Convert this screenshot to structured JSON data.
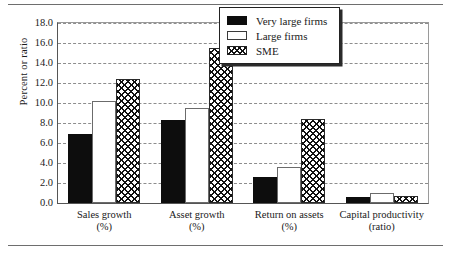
{
  "chart_data": {
    "type": "bar",
    "title": "",
    "xlabel": "",
    "ylabel": "Percent or ratio",
    "ylim": [
      0.0,
      18.0
    ],
    "ytick_step": 2.0,
    "ytick_labels": [
      "0.0",
      "2.0",
      "4.0",
      "6.0",
      "8.0",
      "10.0",
      "12.0",
      "14.0",
      "16.0",
      "18.0"
    ],
    "grid": "horizontal-dashed",
    "legend_position": "top-right",
    "categories": [
      {
        "name": "Sales growth",
        "unit": "(%)"
      },
      {
        "name": "Asset growth",
        "unit": "(%)"
      },
      {
        "name": "Return on assets",
        "unit": "(%)"
      },
      {
        "name": "Capital productivity",
        "unit": "(ratio)"
      }
    ],
    "series": [
      {
        "name": "Very large firms",
        "fill": "solid-black",
        "color": "#0d0d0d",
        "values": [
          6.9,
          8.3,
          2.6,
          0.65
        ]
      },
      {
        "name": "Large firms",
        "fill": "white-outline",
        "color": "#ffffff",
        "values": [
          10.2,
          9.5,
          3.6,
          1.0
        ]
      },
      {
        "name": "SME",
        "fill": "checkered",
        "color": "#ffffff",
        "values": [
          12.4,
          15.5,
          8.4,
          0.75
        ]
      }
    ]
  },
  "figure": {
    "rule_color": "#6e6e6e"
  }
}
